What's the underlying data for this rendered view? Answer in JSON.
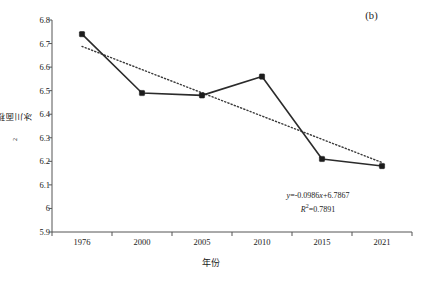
{
  "panel": {
    "label": "(b)"
  },
  "annotation": {
    "equation_prefix": "y",
    "equation_body": "=-0.0986",
    "equation_var": "x",
    "equation_suffix": "+6.7867",
    "r2_prefix": "R",
    "r2_sup": "2",
    "r2_value": "=0.7891"
  },
  "axis": {
    "x_title": "年份",
    "y_title_text": "冰川面积/km",
    "y_title_sup": "2"
  },
  "chart_data": {
    "type": "line",
    "title": "(b)",
    "xlabel": "年份",
    "ylabel": "冰川面积/km²",
    "categories": [
      "1976",
      "2000",
      "2005",
      "2010",
      "2015",
      "2021"
    ],
    "values": [
      6.74,
      6.49,
      6.48,
      6.56,
      6.21,
      6.18
    ],
    "ylim": [
      5.9,
      6.8
    ],
    "ytick_step": 0.1,
    "yticks": [
      "6.8",
      "6.7",
      "6.6",
      "6.5",
      "6.4",
      "6.3",
      "6.2",
      "6.1",
      "6",
      "5.9"
    ],
    "ytick_values": [
      6.8,
      6.7,
      6.6,
      6.5,
      6.4,
      6.3,
      6.2,
      6.1,
      6.0,
      5.9
    ],
    "grid": false,
    "legend": "none",
    "series": [
      {
        "name": "冰川面积",
        "style": "solid-marker",
        "color": "#2b2b2b",
        "values": [
          6.74,
          6.49,
          6.48,
          6.56,
          6.21,
          6.18
        ]
      },
      {
        "name": "线性趋势线",
        "style": "dotted",
        "color": "#3a3a3a",
        "equation": "y=-0.0986x+6.7867",
        "r_squared": 0.7891,
        "endpoints": [
          6.688,
          6.195
        ]
      }
    ],
    "annotations": [
      {
        "text": "y=-0.0986x+6.7867",
        "x": "2013",
        "y": 6.055
      },
      {
        "text": "R²=0.7891",
        "x": "2013",
        "y": 6.015
      }
    ]
  },
  "colors": {
    "axis": "#555555",
    "line": "#2b2b2b",
    "marker": "#1c1c1c",
    "trend": "#3a3a3a",
    "text": "#1a1a1a",
    "background": "#ffffff"
  }
}
